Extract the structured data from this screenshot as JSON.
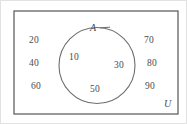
{
  "figure": {
    "type": "venn-diagram",
    "background_color": "#ffffff",
    "outer_border_color": "#e2e2e2",
    "rectangle": {
      "label": "U",
      "stroke_color": "#555555",
      "stroke_width": 1.2,
      "x": 13,
      "y": 10,
      "width": 164,
      "height": 103
    },
    "circle": {
      "label": "A",
      "stroke_color": "#6e6e6e",
      "stroke_width": 1.1,
      "cx": 96,
      "cy": 64.5,
      "r": 38
    },
    "leader_line": {
      "name": "a-label-leader",
      "stroke_color": "#6e6e6e",
      "x1": 99,
      "y1": 27,
      "x2": 108,
      "y2": 26.5
    }
  },
  "labels": {
    "set_a": "A",
    "universal_set": "U"
  },
  "elements": {
    "inside_a": [
      {
        "value": "10"
      },
      {
        "value": "30"
      },
      {
        "value": "50"
      }
    ],
    "outside_a_left": [
      {
        "value": "20"
      },
      {
        "value": "40"
      },
      {
        "value": "60"
      }
    ],
    "outside_a_right": [
      {
        "value": "70"
      },
      {
        "value": "80"
      },
      {
        "value": "90"
      }
    ]
  },
  "text_color": "#4a4a4a"
}
